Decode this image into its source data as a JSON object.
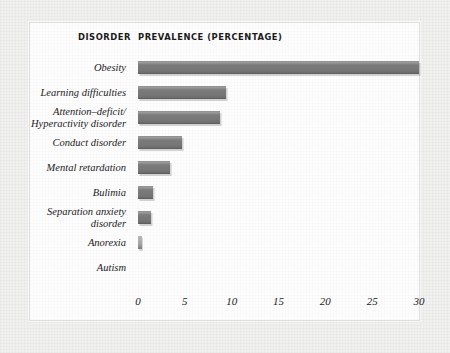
{
  "figure": {
    "header_disorder": "DISORDER",
    "header_prevalence": "PREVALENCE (PERCENTAGE)",
    "bar_color": "#767676",
    "plate_color": "#fdfdfd",
    "background_color": "#f1f1f0"
  },
  "chart_data": {
    "type": "bar",
    "orientation": "horizontal",
    "title": "PREVALENCE (PERCENTAGE)",
    "xlabel": "",
    "ylabel": "DISORDER",
    "xlim": [
      0,
      30
    ],
    "grid": false,
    "legend": null,
    "xticks": [
      "0",
      "5",
      "10",
      "15",
      "20",
      "25",
      "30"
    ],
    "xtick_values": [
      0,
      5,
      10,
      15,
      20,
      25,
      30
    ],
    "categories": [
      "Obesity",
      "Learning difficulties",
      "Attention–deficit/ Hyperactivity disorder",
      "Conduct disorder",
      "Mental retardation",
      "Bulimia",
      "Separation anxiety disorder",
      "Anorexia",
      "Autism"
    ],
    "category_lines": [
      [
        "Obesity"
      ],
      [
        "Learning difficulties"
      ],
      [
        "Attention–deficit/",
        "Hyperactivity disorder"
      ],
      [
        "Conduct disorder"
      ],
      [
        "Mental retardation"
      ],
      [
        "Bulimia"
      ],
      [
        "Separation anxiety",
        "disorder"
      ],
      [
        "Anorexia"
      ],
      [
        "Autism"
      ]
    ],
    "values": [
      30,
      9.4,
      8.8,
      4.7,
      3.4,
      1.6,
      1.4,
      0.4,
      0
    ]
  }
}
